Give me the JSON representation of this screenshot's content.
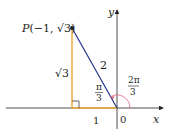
{
  "diagram": {
    "point_label": "P(−1, √3)",
    "point_prefix": "P",
    "point_coords": "(−1, ",
    "point_sqrt": "√3",
    "point_close": ")",
    "vertical_side": "√3",
    "hypotenuse": "2",
    "base": "1",
    "origin": "0",
    "x_axis": "x",
    "y_axis": "y",
    "inner_angle_num": "π",
    "inner_angle_den": "3",
    "outer_angle_num": "2π",
    "outer_angle_den": "3"
  },
  "colors": {
    "hypotenuse": "#2b3a8f",
    "legs": "#f0a830",
    "arc": "#e0607a",
    "axes": "#231f20"
  }
}
